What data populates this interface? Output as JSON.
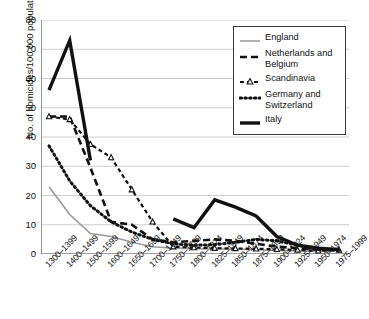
{
  "chart_data": {
    "type": "line",
    "title": "",
    "xlabel": "",
    "ylabel": "No. of homicides/100 000 population",
    "ylim": [
      0,
      80
    ],
    "ytick_step": 10,
    "yticks": [
      80,
      70,
      60,
      50,
      40,
      30,
      20,
      10,
      0
    ],
    "grid": true,
    "grid_axis": "y",
    "legend_position": "top-right",
    "categories": [
      "1300–1399",
      "1400–1499",
      "1500–1599",
      "1600–1649",
      "1650–1699",
      "1700–1749",
      "1750–1799",
      "1800–1824",
      "1825–1849",
      "1850–1874",
      "1875–1899",
      "1900–1924",
      "1925–1949",
      "1950–1974",
      "1975–1999"
    ],
    "series": [
      {
        "name": "England",
        "color": "#9a9a9a",
        "style": "solid-thin",
        "marker": "none",
        "values": [
          23,
          13.5,
          7,
          6,
          4,
          2.5,
          2,
          1.8,
          1.7,
          1.6,
          1.5,
          1.2,
          1,
          0.9,
          1.2
        ]
      },
      {
        "name": "Netherlands and Belgium",
        "color": "#111111",
        "style": "dashed",
        "marker": "none",
        "values": [
          47,
          47,
          29.5,
          11,
          10,
          5,
          4,
          4.5,
          5,
          4.5,
          3.5,
          2.5,
          2,
          1.5,
          1.8
        ]
      },
      {
        "name": "Scandinavia",
        "color": "#111111",
        "style": "dash-dot-marker",
        "marker": "triangle",
        "values": [
          47,
          46,
          37.5,
          33,
          22,
          11,
          2.5,
          2.2,
          2,
          1.9,
          1.8,
          1.6,
          1.4,
          1.1,
          1.4
        ]
      },
      {
        "name": "Germany and Switzerland",
        "color": "#111111",
        "style": "dotted",
        "marker": "none",
        "values": [
          37,
          25,
          16.5,
          11,
          7.5,
          5,
          3.5,
          3,
          3.2,
          4,
          5,
          4.5,
          3,
          1.5,
          1.3
        ]
      },
      {
        "name": "Italy",
        "color": "#111111",
        "style": "solid-thick",
        "marker": "none",
        "values": [
          56,
          73,
          32,
          null,
          null,
          null,
          12,
          9,
          18.5,
          16,
          13,
          6,
          3,
          2,
          1.5
        ]
      }
    ]
  },
  "legend": {
    "items": [
      {
        "label": "England",
        "swatch": "solid-thin-line-icon"
      },
      {
        "label": "Netherlands and Belgium",
        "swatch": "dashed-line-icon"
      },
      {
        "label": "Scandinavia",
        "swatch": "triangle-marker-line-icon"
      },
      {
        "label": "Germany and Switzerland",
        "swatch": "dotted-line-icon"
      },
      {
        "label": "Italy",
        "swatch": "solid-thick-line-icon"
      }
    ]
  }
}
